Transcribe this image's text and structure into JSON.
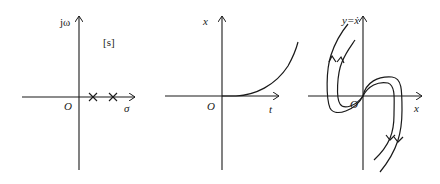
{
  "panels": [
    {
      "id": "s-plane",
      "y_axis_label": "jω",
      "x_axis_label": "σ",
      "origin_label": "O",
      "plane_label": "[s]",
      "markers": [
        {
          "type": "pole",
          "symbol": "×",
          "position": "positive real axis, near origin"
        },
        {
          "type": "pole",
          "symbol": "×",
          "position": "positive real axis, further right"
        }
      ]
    },
    {
      "id": "time-response",
      "y_axis_label": "x",
      "x_axis_label": "t",
      "origin_label": "O",
      "curve": "exponentially diverging response starting at origin"
    },
    {
      "id": "phase-plane",
      "y_axis_label": "y=ẋ",
      "x_axis_label": "x",
      "origin_label": "O",
      "curve": "phase trajectories diverging away from origin (unstable node)"
    }
  ],
  "colors": {
    "ink": "#1a1a1a",
    "background": "#ffffff"
  }
}
